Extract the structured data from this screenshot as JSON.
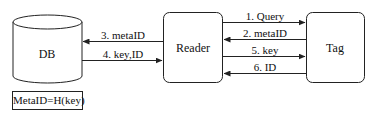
{
  "nodes": {
    "db": {
      "label": "DB"
    },
    "reader": {
      "label": "Reader"
    },
    "tag": {
      "label": "Tag"
    }
  },
  "formula": "MetaID=H(key)",
  "edges": {
    "reader_tag": [
      {
        "label": "1. Query",
        "direction": "reader-to-tag"
      },
      {
        "label": "2. metaID",
        "direction": "tag-to-reader"
      },
      {
        "label": "5. key",
        "direction": "reader-to-tag"
      },
      {
        "label": "6. ID",
        "direction": "tag-to-reader"
      }
    ],
    "db_reader": [
      {
        "label": "3. metaID",
        "direction": "reader-to-db"
      },
      {
        "label": "4. key,ID",
        "direction": "db-to-reader"
      }
    ]
  },
  "colors": {
    "stroke": "#222222",
    "background": "#ffffff"
  }
}
